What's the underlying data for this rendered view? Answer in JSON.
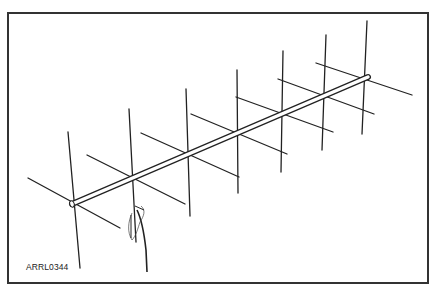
{
  "figure": {
    "label": "ARRL0344",
    "element_count": 7,
    "line_color": "#222222",
    "frame_color": "#333333",
    "background": "#ffffff"
  },
  "boom": {
    "x1": 72,
    "y1": 204,
    "x2": 368,
    "y2": 77
  },
  "elements": [
    {
      "name": "reflector",
      "vert": [
        68,
        132,
        80,
        268
      ],
      "horiz": [
        28,
        178,
        120,
        228
      ]
    },
    {
      "name": "driven",
      "vert": [
        129,
        109,
        136,
        242
      ],
      "horiz": [
        87,
        155,
        185,
        204
      ]
    },
    {
      "name": "director-1",
      "vert": [
        186,
        89,
        190,
        216
      ],
      "horiz": [
        141,
        133,
        239,
        177
      ]
    },
    {
      "name": "director-2",
      "vert": [
        237,
        70,
        238,
        193
      ],
      "horiz": [
        191,
        114,
        287,
        154
      ]
    },
    {
      "name": "director-3",
      "vert": [
        283,
        51,
        281,
        172
      ],
      "horiz": [
        236,
        97,
        333,
        132
      ]
    },
    {
      "name": "director-4",
      "vert": [
        326,
        35,
        322,
        150
      ],
      "horiz": [
        278,
        79,
        374,
        114
      ]
    },
    {
      "name": "director-5",
      "vert": [
        367,
        21,
        362,
        134
      ],
      "horiz": [
        316,
        63,
        412,
        95
      ]
    }
  ]
}
